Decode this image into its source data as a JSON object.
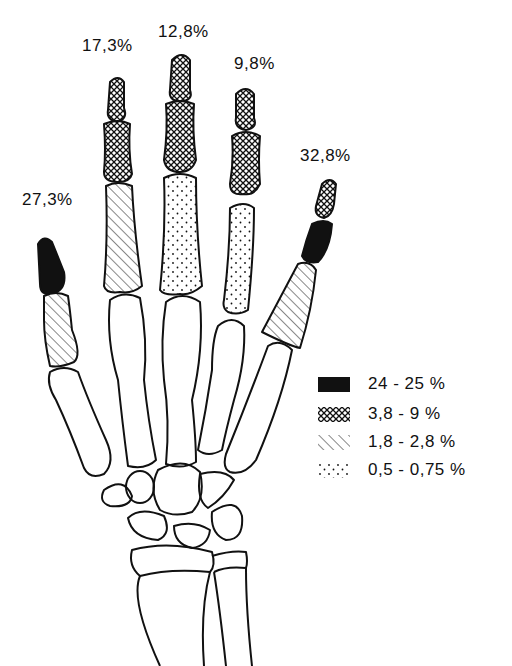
{
  "figure": {
    "digit_labels": [
      {
        "id": "thumb",
        "text": "27,3%"
      },
      {
        "id": "index",
        "text": "17,3%"
      },
      {
        "id": "middle",
        "text": "12,8%"
      },
      {
        "id": "ring",
        "text": "9,8%"
      },
      {
        "id": "little",
        "text": "32,8%"
      }
    ],
    "legend": [
      {
        "pattern": "solid-black",
        "label": "24 - 25 %"
      },
      {
        "pattern": "crosshatch",
        "label": "3,8 -   9 %"
      },
      {
        "pattern": "diagonal-hatch",
        "label": "1,8 - 2,8 %"
      },
      {
        "pattern": "dotted",
        "label": "0,5 - 0,75 %"
      }
    ],
    "colors": {
      "ink": "#111111",
      "background": "#ffffff"
    }
  }
}
